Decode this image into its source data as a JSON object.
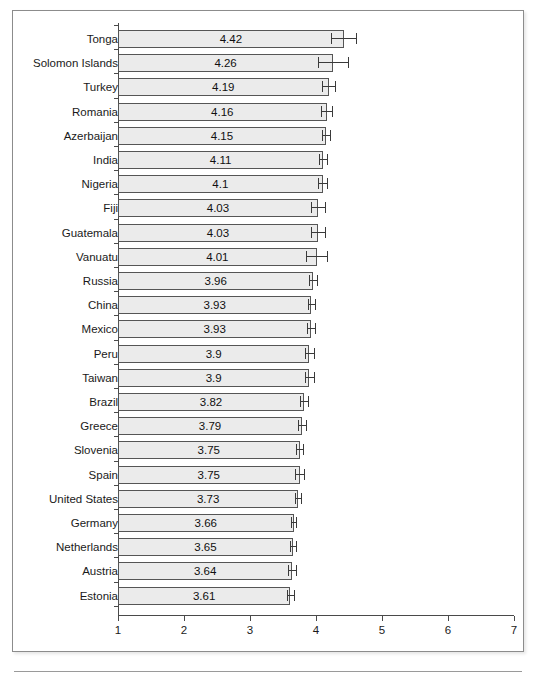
{
  "figure": {
    "caption_sliver_text": "",
    "background_color": "#ffffff",
    "frame_color": "#8c8c8c",
    "bar_fill_color": "#ebebeb",
    "bar_border_color": "#555555",
    "errorbar_color": "#3a3a3a",
    "axis_color": "#4a4a4a"
  },
  "chart_data": {
    "type": "bar",
    "orientation": "horizontal",
    "title": "",
    "xlabel": "",
    "ylabel": "",
    "xlim": [
      1,
      7
    ],
    "xticks": [
      1,
      2,
      3,
      4,
      5,
      6,
      7
    ],
    "xtick_labels": [
      "1",
      "2",
      "3",
      "4",
      "5",
      "6",
      "7"
    ],
    "grid": false,
    "legend": false,
    "value_labels_shown": true,
    "error_bars": true,
    "sorted": "descending",
    "categories": [
      "Tonga",
      "Solomon Islands",
      "Turkey",
      "Romania",
      "Azerbaijan",
      "India",
      "Nigeria",
      "Fiji",
      "Guatemala",
      "Vanuatu",
      "Russia",
      "China",
      "Mexico",
      "Peru",
      "Taiwan",
      "Brazil",
      "Greece",
      "Slovenia",
      "Spain",
      "United States",
      "Germany",
      "Netherlands",
      "Austria",
      "Estonia"
    ],
    "values": [
      4.42,
      4.26,
      4.19,
      4.16,
      4.15,
      4.11,
      4.1,
      4.03,
      4.03,
      4.01,
      3.96,
      3.93,
      3.93,
      3.9,
      3.9,
      3.82,
      3.79,
      3.75,
      3.75,
      3.73,
      3.66,
      3.65,
      3.64,
      3.61
    ],
    "value_labels": [
      "4.42",
      "4.26",
      "4.19",
      "4.16",
      "4.15",
      "4.11",
      "4.1",
      "4.03",
      "4.03",
      "4.01",
      "3.96",
      "3.93",
      "3.93",
      "3.9",
      "3.9",
      "3.82",
      "3.79",
      "3.75",
      "3.75",
      "3.73",
      "3.66",
      "3.65",
      "3.64",
      "3.61"
    ],
    "ci_low": [
      4.23,
      4.03,
      4.09,
      4.08,
      4.09,
      4.05,
      4.03,
      3.93,
      3.92,
      3.85,
      3.9,
      3.88,
      3.87,
      3.83,
      3.83,
      3.76,
      3.73,
      3.7,
      3.68,
      3.68,
      3.62,
      3.6,
      3.58,
      3.56
    ],
    "ci_high": [
      4.61,
      4.49,
      4.29,
      4.24,
      4.21,
      4.17,
      4.17,
      4.13,
      4.14,
      4.17,
      4.02,
      3.98,
      3.99,
      3.97,
      3.97,
      3.88,
      3.85,
      3.8,
      3.82,
      3.78,
      3.7,
      3.7,
      3.7,
      3.66
    ]
  }
}
